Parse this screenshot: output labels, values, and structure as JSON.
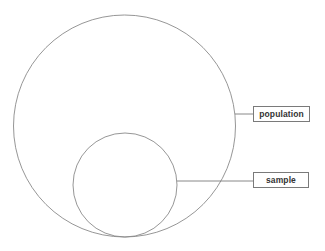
{
  "diagram": {
    "type": "nested-circles",
    "colors": {
      "stroke": "#8a8a8a",
      "background": "#ffffff",
      "label_text": "#333333",
      "label_border": "#7a7a7a"
    },
    "outer_circle": {
      "label": "population",
      "cx": 124.5,
      "cy": 126,
      "r": 111
    },
    "inner_circle": {
      "label": "sample",
      "cx": 125,
      "cy": 185,
      "r": 52
    },
    "labels": [
      {
        "id": "population",
        "text": "population"
      },
      {
        "id": "sample",
        "text": "sample"
      }
    ]
  }
}
